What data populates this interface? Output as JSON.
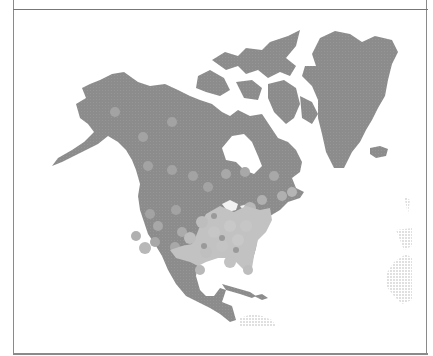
{
  "panel": {
    "title": "",
    "title_clipped": true
  },
  "map": {
    "region": "North America",
    "style": "grayscale hexbin density",
    "colors": {
      "background": "#ffffff",
      "land": "#8c8c8c",
      "hex_low": "#a8a8a8",
      "hex_high": "#c4c4c4",
      "faint_land": "#e2e2e2",
      "border": "#8a8a8a"
    },
    "labels": {
      "greenland": "Greenland",
      "alaska": "Alaska",
      "canada": "Canada",
      "usa": "United States",
      "mexico": "Mexico",
      "caribbean": "Caribbean"
    }
  }
}
